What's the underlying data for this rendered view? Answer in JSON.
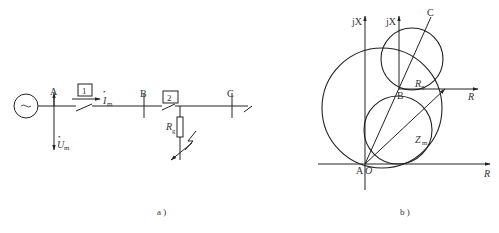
{
  "figure_a": {
    "caption": "a )",
    "buses": {
      "a": "A",
      "b": "B",
      "c": "C"
    },
    "relay_boxes": {
      "box1": "1",
      "box2": "2"
    },
    "current_label": {
      "base": "I",
      "sub": "m",
      "dot": "•"
    },
    "voltage_label": {
      "base": "U",
      "sub": "m",
      "dot": "•"
    },
    "resistance_label": {
      "base": "R",
      "sub": "g"
    },
    "generator_symbol": "~"
  },
  "figure_b": {
    "caption": "b )",
    "axes": {
      "main_y": "jX",
      "main_x": "R",
      "shifted_y": "jX",
      "shifted_x": "R"
    },
    "points": {
      "origin_a": "A",
      "origin_o": "O",
      "b": "B",
      "c": "C"
    },
    "impedance_label": {
      "base": "Z",
      "sub": "m"
    },
    "resistance_label": {
      "base": "R",
      "sub": "g"
    }
  },
  "colors": {
    "line": "#222222",
    "text": "#333333",
    "background": "#ffffff"
  }
}
